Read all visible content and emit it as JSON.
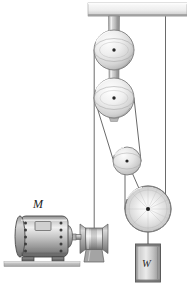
{
  "figure": {
    "background_color": "#ffffff",
    "width": 187,
    "height": 295
  },
  "labels": {
    "motor": "M",
    "weight": "W"
  },
  "colors": {
    "outline": "#3a3a3a",
    "rope": "#5a5a5a",
    "metal_light": "#f2f2f2",
    "metal_mid": "#bdbdbd",
    "metal_dark": "#7d7d7d",
    "ceiling": "#e8e8e8",
    "ground": "#c9c9c9",
    "motor_body": "#a8a8a8",
    "weight_body": "#b5b5b5"
  },
  "components": [
    {
      "name": "ceiling-beam",
      "label": "Ceiling beam",
      "x": 88,
      "y": 3,
      "width": 99,
      "height": 14
    },
    {
      "name": "hanger-bracket",
      "label": "Hanger bracket",
      "x": 108,
      "y": 17,
      "width": 12,
      "height": 104
    },
    {
      "name": "pulley-1",
      "label": "Upper fixed pulley",
      "cx": 114,
      "cy": 50,
      "r": 20
    },
    {
      "name": "pulley-2",
      "label": "Second fixed pulley",
      "cx": 114,
      "cy": 98,
      "r": 20
    },
    {
      "name": "pulley-3",
      "label": "Lower movable pulley",
      "cx": 127,
      "cy": 161,
      "r": 14
    },
    {
      "name": "pulley-4",
      "label": "Load pulley",
      "cx": 148,
      "cy": 209,
      "r": 23
    },
    {
      "name": "winch-drum",
      "label": "Winch drum",
      "cx": 94,
      "cy": 238,
      "width": 30,
      "height": 28
    },
    {
      "name": "motor",
      "label": "Electric motor",
      "x": 17,
      "y": 214,
      "width": 56,
      "height": 45
    },
    {
      "name": "weight-block",
      "label": "Suspended weight",
      "x": 136,
      "y": 243,
      "width": 25,
      "height": 38
    },
    {
      "name": "ground-strip",
      "label": "Floor",
      "x": 5,
      "y": 262,
      "width": 74,
      "height": 6
    }
  ],
  "ropes": [
    {
      "name": "rope-ceiling-to-load-pulley",
      "from": "ceiling-beam",
      "to": "pulley-4"
    },
    {
      "name": "rope-pulley1-to-winch",
      "from": "pulley-1",
      "to": "winch-drum"
    },
    {
      "name": "rope-pulley2-to-pulley3",
      "from": "pulley-2",
      "to": "pulley-3"
    },
    {
      "name": "rope-pulley3-to-pulley4",
      "from": "pulley-3",
      "to": "pulley-4"
    },
    {
      "name": "rope-pulley4-to-weight",
      "from": "pulley-4",
      "to": "weight-block"
    }
  ]
}
